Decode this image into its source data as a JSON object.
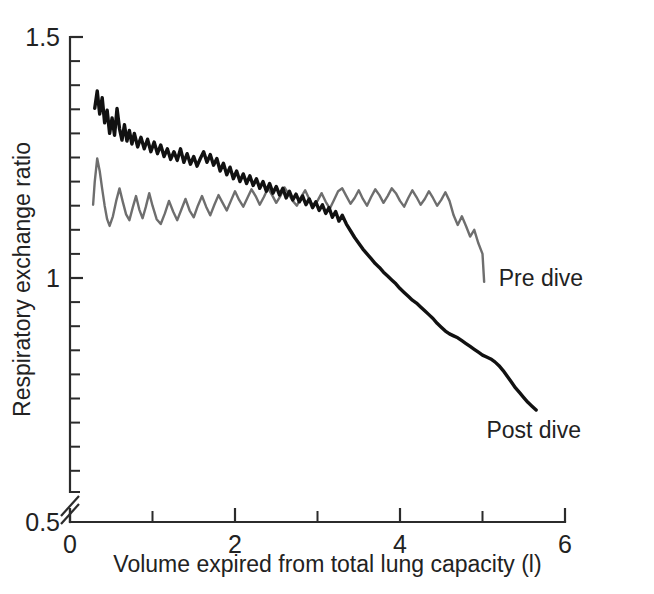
{
  "chart_data": {
    "type": "line",
    "title": "",
    "xlabel": "Volume expired from total lung capacity (l)",
    "ylabel": "Respiratory exchange ratio",
    "xlim": [
      0,
      6
    ],
    "ylim": [
      0.5,
      1.5
    ],
    "y_axis_break": true,
    "y_axis_break_note": "axis broken between 0.5 and lowest plotted tick",
    "grid": false,
    "legend_position": "inline-right",
    "xticks_major": [
      0,
      2,
      4,
      6
    ],
    "xticks_minor": [
      1,
      3,
      5
    ],
    "xtick_labels": [
      "0",
      "2",
      "4",
      "6"
    ],
    "yticks_major": [
      0.5,
      1,
      1.5
    ],
    "ytick_labels": [
      "0.5",
      "1",
      "1.5"
    ],
    "yticks_minor": [
      0.55,
      0.6,
      0.65,
      0.7,
      0.75,
      0.8,
      0.85,
      0.9,
      0.95,
      1.05,
      1.1,
      1.15,
      1.2,
      1.25,
      1.3,
      1.35,
      1.4,
      1.45
    ],
    "series": [
      {
        "name": "Pre dive",
        "label": "Pre dive",
        "color": "#6e6e6e",
        "stroke_width": 2.4,
        "label_x": 5.1,
        "label_y": 1.0,
        "x": [
          0.28,
          0.3,
          0.33,
          0.36,
          0.39,
          0.42,
          0.45,
          0.48,
          0.52,
          0.56,
          0.6,
          0.64,
          0.68,
          0.72,
          0.76,
          0.8,
          0.84,
          0.88,
          0.92,
          0.96,
          1.0,
          1.05,
          1.1,
          1.15,
          1.2,
          1.25,
          1.3,
          1.35,
          1.4,
          1.45,
          1.5,
          1.55,
          1.6,
          1.65,
          1.7,
          1.75,
          1.8,
          1.85,
          1.9,
          1.95,
          2.0,
          2.05,
          2.1,
          2.15,
          2.2,
          2.25,
          2.3,
          2.35,
          2.4,
          2.45,
          2.5,
          2.55,
          2.6,
          2.65,
          2.7,
          2.75,
          2.8,
          2.85,
          2.9,
          2.95,
          3.0,
          3.05,
          3.1,
          3.15,
          3.2,
          3.25,
          3.3,
          3.35,
          3.4,
          3.45,
          3.5,
          3.55,
          3.6,
          3.65,
          3.7,
          3.75,
          3.8,
          3.85,
          3.9,
          3.95,
          4.0,
          4.05,
          4.1,
          4.15,
          4.2,
          4.25,
          4.3,
          4.35,
          4.4,
          4.45,
          4.5,
          4.55,
          4.6,
          4.65,
          4.7,
          4.75,
          4.8,
          4.85,
          4.9,
          4.95,
          5.0,
          5.02
        ],
        "y": [
          1.152,
          1.2,
          1.248,
          1.222,
          1.185,
          1.15,
          1.122,
          1.108,
          1.128,
          1.16,
          1.186,
          1.158,
          1.132,
          1.12,
          1.146,
          1.17,
          1.142,
          1.124,
          1.148,
          1.176,
          1.15,
          1.122,
          1.112,
          1.134,
          1.16,
          1.138,
          1.12,
          1.142,
          1.164,
          1.14,
          1.126,
          1.15,
          1.17,
          1.148,
          1.13,
          1.152,
          1.172,
          1.156,
          1.14,
          1.16,
          1.18,
          1.162,
          1.148,
          1.166,
          1.184,
          1.17,
          1.152,
          1.168,
          1.186,
          1.172,
          1.156,
          1.17,
          1.188,
          1.174,
          1.16,
          1.15,
          1.168,
          1.182,
          1.164,
          1.148,
          1.16,
          1.176,
          1.158,
          1.144,
          1.162,
          1.18,
          1.186,
          1.17,
          1.154,
          1.166,
          1.182,
          1.164,
          1.15,
          1.168,
          1.184,
          1.172,
          1.156,
          1.17,
          1.186,
          1.176,
          1.16,
          1.148,
          1.166,
          1.182,
          1.168,
          1.152,
          1.164,
          1.18,
          1.166,
          1.15,
          1.162,
          1.178,
          1.16,
          1.13,
          1.11,
          1.128,
          1.108,
          1.086,
          1.1,
          1.072,
          1.05,
          0.992
        ]
      },
      {
        "name": "Post dive",
        "label": "Post dive",
        "color": "#111111",
        "stroke_width": 3.4,
        "label_x": 4.95,
        "label_y": 0.685,
        "x": [
          0.3,
          0.33,
          0.36,
          0.39,
          0.42,
          0.45,
          0.48,
          0.51,
          0.54,
          0.57,
          0.6,
          0.63,
          0.66,
          0.69,
          0.72,
          0.75,
          0.78,
          0.82,
          0.86,
          0.9,
          0.94,
          0.98,
          1.02,
          1.06,
          1.1,
          1.14,
          1.18,
          1.22,
          1.26,
          1.3,
          1.34,
          1.38,
          1.42,
          1.46,
          1.5,
          1.54,
          1.58,
          1.62,
          1.66,
          1.7,
          1.74,
          1.78,
          1.82,
          1.86,
          1.9,
          1.94,
          1.98,
          2.02,
          2.06,
          2.1,
          2.14,
          2.18,
          2.22,
          2.26,
          2.3,
          2.34,
          2.38,
          2.42,
          2.46,
          2.5,
          2.54,
          2.58,
          2.62,
          2.66,
          2.7,
          2.74,
          2.78,
          2.82,
          2.86,
          2.9,
          2.94,
          2.98,
          3.02,
          3.06,
          3.1,
          3.14,
          3.18,
          3.22,
          3.26,
          3.3,
          3.35,
          3.4,
          3.45,
          3.5,
          3.55,
          3.6,
          3.65,
          3.7,
          3.75,
          3.8,
          3.85,
          3.9,
          3.95,
          4.0,
          4.05,
          4.1,
          4.15,
          4.2,
          4.25,
          4.3,
          4.35,
          4.4,
          4.45,
          4.5,
          4.55,
          4.6,
          4.65,
          4.7,
          4.75,
          4.8,
          4.85,
          4.9,
          4.95,
          5.0,
          5.05,
          5.1,
          5.15,
          5.2,
          5.25,
          5.3,
          5.35,
          5.4,
          5.45,
          5.5,
          5.55,
          5.6,
          5.65
        ],
        "y": [
          1.352,
          1.388,
          1.34,
          1.374,
          1.322,
          1.348,
          1.3,
          1.332,
          1.296,
          1.352,
          1.31,
          1.286,
          1.318,
          1.284,
          1.306,
          1.278,
          1.3,
          1.272,
          1.292,
          1.268,
          1.288,
          1.262,
          1.282,
          1.258,
          1.276,
          1.252,
          1.268,
          1.246,
          1.262,
          1.244,
          1.268,
          1.24,
          1.258,
          1.236,
          1.252,
          1.232,
          1.248,
          1.262,
          1.24,
          1.256,
          1.234,
          1.248,
          1.222,
          1.238,
          1.214,
          1.23,
          1.206,
          1.222,
          1.2,
          1.216,
          1.196,
          1.212,
          1.192,
          1.206,
          1.186,
          1.2,
          1.18,
          1.196,
          1.176,
          1.19,
          1.172,
          1.186,
          1.166,
          1.18,
          1.162,
          1.174,
          1.158,
          1.17,
          1.152,
          1.164,
          1.146,
          1.158,
          1.14,
          1.152,
          1.134,
          1.146,
          1.126,
          1.138,
          1.118,
          1.13,
          1.112,
          1.098,
          1.084,
          1.072,
          1.06,
          1.05,
          1.04,
          1.03,
          1.022,
          1.012,
          1.004,
          0.996,
          0.988,
          0.978,
          0.97,
          0.962,
          0.954,
          0.948,
          0.94,
          0.932,
          0.924,
          0.916,
          0.906,
          0.898,
          0.89,
          0.884,
          0.88,
          0.876,
          0.87,
          0.864,
          0.858,
          0.852,
          0.846,
          0.84,
          0.836,
          0.832,
          0.826,
          0.818,
          0.808,
          0.796,
          0.784,
          0.772,
          0.762,
          0.752,
          0.742,
          0.734,
          0.726
        ]
      }
    ]
  }
}
